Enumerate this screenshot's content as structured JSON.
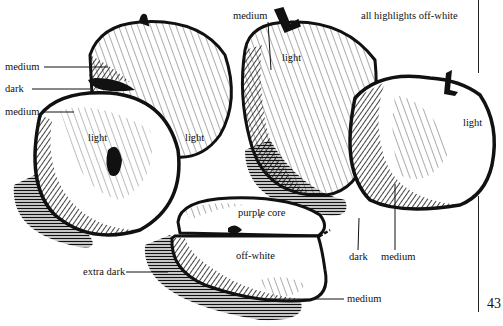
{
  "page": {
    "page_number": "43",
    "note": "all highlights off-white"
  },
  "labels": {
    "left_apples": {
      "medium_top": "medium",
      "dark": "dark",
      "medium_mid": "medium",
      "light_front": "light",
      "light_back": "light"
    },
    "right_apples": {
      "medium_top": "medium",
      "light_tall": "light",
      "light_right": "light",
      "dark_bottom": "dark",
      "medium_bottom": "medium"
    },
    "sliced_apple": {
      "purple_core": "purple core",
      "off_white": "off-white",
      "extra_dark": "extra dark",
      "medium": "medium"
    }
  },
  "colors": {
    "ink": "#111111",
    "paper": "#ffffff"
  }
}
